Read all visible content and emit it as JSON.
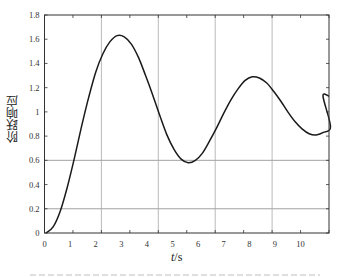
{
  "chart_data": {
    "type": "line",
    "title": "",
    "xlabel": "t/s",
    "ylabel": "阶跃响应",
    "xlim": [
      0,
      10
    ],
    "ylim": [
      0,
      1.8
    ],
    "x_tick_labels": [
      "0",
      "1",
      "2",
      "3",
      "4",
      "5",
      "6",
      "7",
      "8",
      "9",
      "10"
    ],
    "y_tick_labels": [
      "0",
      "0.2",
      "0.4",
      "0.6",
      "0.8",
      "1",
      "1.2",
      "1.4",
      "1.6",
      "1.8"
    ],
    "grid": {
      "horizontal_at": [
        0.2,
        0.6
      ],
      "vertical_at_tick_index": [
        2,
        4,
        6,
        8
      ]
    },
    "legend": null,
    "series": [
      {
        "name": "step response",
        "color": "#1a1a1a",
        "x": [
          0,
          0.25,
          0.5,
          0.75,
          1.0,
          1.25,
          1.5,
          1.75,
          2.0,
          2.25,
          2.5,
          2.75,
          3.0,
          3.25,
          3.5,
          3.75,
          4.0,
          4.25,
          4.5,
          4.75,
          5.0,
          5.25,
          5.5,
          5.75,
          6.0,
          6.25,
          6.5,
          6.75,
          7.0,
          7.25,
          7.5,
          7.75,
          8.0,
          8.25,
          8.5,
          8.75,
          9.0,
          9.25,
          9.5,
          9.75,
          10.0
        ],
        "y": [
          0,
          0.05,
          0.18,
          0.38,
          0.62,
          0.88,
          1.12,
          1.33,
          1.48,
          1.58,
          1.63,
          1.62,
          1.56,
          1.45,
          1.3,
          1.14,
          0.97,
          0.81,
          0.69,
          0.61,
          0.58,
          0.6,
          0.66,
          0.76,
          0.87,
          0.99,
          1.1,
          1.19,
          1.26,
          1.29,
          1.28,
          1.24,
          1.17,
          1.09,
          1.0,
          0.92,
          0.86,
          0.82,
          0.81,
          0.83,
          0.88
        ]
      }
    ]
  },
  "caption": {
    "visible": "partial (cut off at bottom edge, illegible)"
  }
}
